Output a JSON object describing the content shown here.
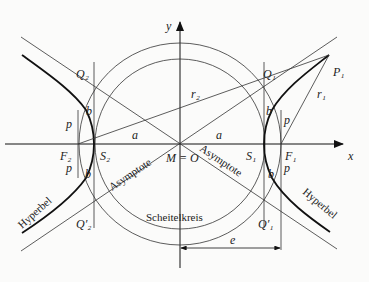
{
  "diagram": {
    "center": {
      "label": "M = O",
      "x": 180,
      "y": 144
    },
    "axes": {
      "x_label": "x",
      "y_label": "y"
    },
    "points": {
      "S1": "S₁",
      "S2": "S₂",
      "F1": "F₁",
      "F2": "F₂",
      "Q1": "Q₁",
      "Q2": "Q₂",
      "Q1p": "Q′₁",
      "Q2p": "Q′₂",
      "P1": "P₁"
    },
    "segments": {
      "a": "a",
      "b": "b",
      "p": "p",
      "e": "e",
      "r1": "r₁",
      "r2": "r₂"
    },
    "captions": {
      "asymptote": "Asymptote",
      "hyperbel": "Hyperbel",
      "scheitelkreis": "Scheitelkreis"
    }
  }
}
